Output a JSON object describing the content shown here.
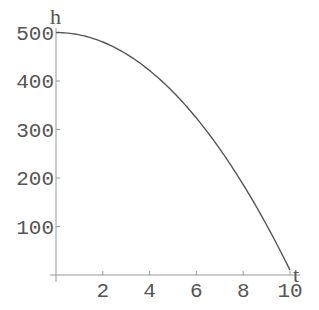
{
  "chart_data": {
    "type": "line",
    "title": "",
    "xlabel": "t",
    "ylabel": "h",
    "xlim": [
      0,
      10.2
    ],
    "ylim": [
      0,
      510
    ],
    "x_ticks": [
      2,
      4,
      6,
      8,
      10
    ],
    "y_ticks": [
      100,
      200,
      300,
      400,
      500
    ],
    "grid": false,
    "legend": null,
    "series": [
      {
        "name": "h(t)",
        "function": "h = 500 - 4.9 t^2",
        "x": [
          0,
          1,
          2,
          3,
          4,
          5,
          6,
          7,
          8,
          9,
          10
        ],
        "values": [
          500,
          495.1,
          480.4,
          455.9,
          421.6,
          377.5,
          323.6,
          259.9,
          186.4,
          103.1,
          10
        ]
      }
    ],
    "colors": {
      "axis": "#999999",
      "line": "#555555",
      "text": "#555555"
    }
  }
}
